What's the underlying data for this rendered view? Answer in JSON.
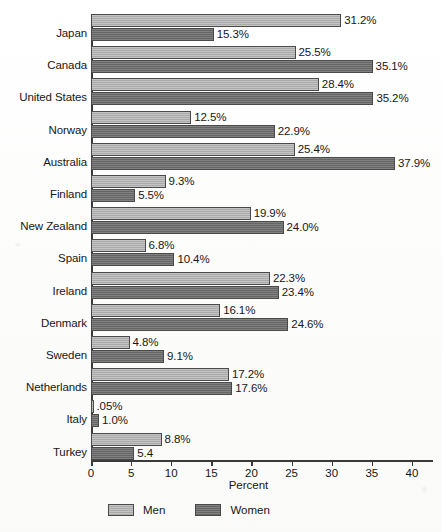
{
  "chart_data": {
    "type": "bar",
    "orientation": "horizontal",
    "title": "",
    "xlabel": "Percent",
    "ylabel": "",
    "xlim": [
      0,
      43
    ],
    "grid": false,
    "legend_position": "bottom",
    "categories": [
      "Japan",
      "Canada",
      "United States",
      "Norway",
      "Australia",
      "Finland",
      "New Zealand",
      "Spain",
      "Ireland",
      "Denmark",
      "Sweden",
      "Netherlands",
      "Italy",
      "Turkey"
    ],
    "xticks": [
      0,
      5,
      10,
      15,
      20,
      25,
      30,
      35,
      40
    ],
    "xtick_labels": [
      "0",
      "5",
      "10",
      "15",
      "20",
      "25",
      "30",
      "35",
      "40"
    ],
    "series": [
      {
        "name": "Men",
        "color": "#b3b3b3",
        "values": [
          31.2,
          25.5,
          28.4,
          12.5,
          25.4,
          9.3,
          19.9,
          6.8,
          22.3,
          16.1,
          4.8,
          17.2,
          0.05,
          8.8
        ],
        "labels": [
          "31.2%",
          "25.5%",
          "28.4%",
          "12.5%",
          "25.4%",
          "9.3%",
          "19.9%",
          "6.8%",
          "22.3%",
          "16.1%",
          "4.8%",
          "17.2%",
          ".05%",
          "8.8%"
        ]
      },
      {
        "name": "Women",
        "color": "#6e6e6e",
        "values": [
          15.3,
          35.1,
          35.2,
          22.9,
          37.9,
          5.5,
          24.0,
          10.4,
          23.4,
          24.6,
          9.1,
          17.6,
          1.0,
          5.4
        ],
        "labels": [
          "15.3%",
          "35.1%",
          "35.2%",
          "22.9%",
          "37.9%",
          "5.5%",
          "24.0%",
          "10.4%",
          "23.4%",
          "24.6%",
          "9.1%",
          "17.6%",
          "1.0%",
          "5.4"
        ]
      }
    ]
  }
}
